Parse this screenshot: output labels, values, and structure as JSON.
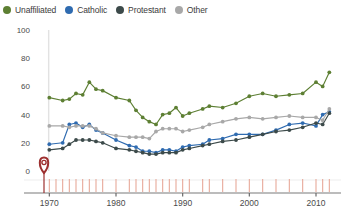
{
  "legend": {
    "items": [
      {
        "label": "Unaffiliated",
        "color": "#5d7f33",
        "key": "unaffiliated"
      },
      {
        "label": "Catholic",
        "color": "#2f6bb0",
        "key": "catholic"
      },
      {
        "label": "Protestant",
        "color": "#3c4a4a",
        "key": "protestant"
      },
      {
        "label": "Other",
        "color": "#a8a8a8",
        "key": "other"
      }
    ]
  },
  "marker": {
    "name": "map-pin-marker",
    "color": "#9d2f2f",
    "x_year": 1969.2
  },
  "chart_data": {
    "type": "line",
    "title": "",
    "xlabel": "",
    "ylabel": "",
    "xlim": [
      1968,
      2013
    ],
    "ylim": [
      0,
      100
    ],
    "grid": false,
    "legend_position": "top-left",
    "y_ticks": [
      0,
      20,
      40,
      60,
      80,
      100
    ],
    "x_ticks": [
      1970,
      1980,
      1990,
      2000,
      2010
    ],
    "x_tick_labels": [
      "1970",
      "1980",
      "1990",
      "2000",
      "2010"
    ],
    "y_tick_labels": [
      "0",
      "20",
      "40",
      "60",
      "80",
      "100"
    ],
    "survey_years": [
      1970,
      1971,
      1972,
      1973,
      1974,
      1975,
      1976,
      1977,
      1978,
      1980,
      1982,
      1983,
      1984,
      1985,
      1986,
      1987,
      1988,
      1989,
      1990,
      1991,
      1993,
      1994,
      1996,
      1998,
      2000,
      2002,
      2004,
      2006,
      2008,
      2010,
      2011,
      2012
    ],
    "series": [
      {
        "name": "Unaffiliated",
        "color": "#5d7f33",
        "x": [
          1970,
          1972,
          1973,
          1974,
          1975,
          1976,
          1977,
          1978,
          1980,
          1982,
          1983,
          1984,
          1985,
          1986,
          1987,
          1988,
          1989,
          1990,
          1991,
          1993,
          1994,
          1996,
          1998,
          2000,
          2002,
          2004,
          2006,
          2008,
          2010,
          2011,
          2012
        ],
        "values": [
          52,
          50,
          51,
          55,
          54,
          63,
          58,
          57,
          52,
          50,
          43,
          38,
          35,
          33,
          40,
          41,
          45,
          39,
          41,
          44,
          46,
          45,
          48,
          53,
          55,
          53,
          54,
          55,
          63,
          60,
          70
        ]
      },
      {
        "name": "Catholic",
        "color": "#2f6bb0",
        "x": [
          1970,
          1972,
          1973,
          1974,
          1975,
          1976,
          1977,
          1978,
          1980,
          1982,
          1983,
          1984,
          1985,
          1986,
          1987,
          1988,
          1989,
          1990,
          1991,
          1993,
          1994,
          1996,
          1998,
          2000,
          2002,
          2004,
          2006,
          2008,
          2010,
          2011,
          2012
        ],
        "values": [
          19,
          20,
          33,
          34,
          31,
          33,
          29,
          27,
          22,
          18,
          17,
          14,
          14,
          13,
          15,
          15,
          14,
          17,
          18,
          19,
          22,
          23,
          26,
          26,
          26,
          29,
          33,
          34,
          32,
          40,
          42
        ]
      },
      {
        "name": "Protestant",
        "color": "#3c4a4a",
        "x": [
          1970,
          1972,
          1973,
          1974,
          1975,
          1976,
          1977,
          1978,
          1980,
          1982,
          1983,
          1984,
          1985,
          1986,
          1987,
          1988,
          1989,
          1990,
          1991,
          1993,
          1994,
          1996,
          1998,
          2000,
          2002,
          2004,
          2006,
          2008,
          2010,
          2011,
          2012
        ],
        "values": [
          15,
          16,
          19,
          22,
          22,
          22,
          21,
          20,
          16,
          15,
          14,
          13,
          12,
          12,
          13,
          13,
          13,
          15,
          16,
          18,
          19,
          21,
          22,
          24,
          26,
          28,
          29,
          31,
          34,
          33,
          41
        ]
      },
      {
        "name": "Other",
        "color": "#a8a8a8",
        "x": [
          1970,
          1972,
          1973,
          1974,
          1975,
          1976,
          1977,
          1978,
          1980,
          1982,
          1983,
          1984,
          1985,
          1986,
          1987,
          1988,
          1989,
          1990,
          1991,
          1993,
          1994,
          1996,
          1998,
          2000,
          2002,
          2004,
          2006,
          2008,
          2010,
          2011,
          2012
        ],
        "values": [
          32,
          32,
          31,
          32,
          32,
          32,
          30,
          27,
          25,
          24,
          24,
          24,
          23,
          28,
          30,
          30,
          30,
          28,
          29,
          31,
          33,
          35,
          37,
          38,
          37,
          38,
          39,
          38,
          38,
          36,
          44
        ]
      }
    ]
  }
}
